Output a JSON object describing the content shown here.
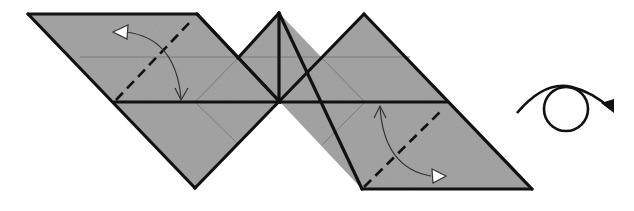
{
  "diagram": {
    "type": "origami-fold-diagram",
    "colors": {
      "paper_fill": "#a6a6a6",
      "edge": "#111111",
      "crease": "#7a7a7a",
      "arrow": "#333333",
      "background": "#ffffff"
    },
    "steps": [
      {
        "id": "valley-fold-left",
        "kind": "valley-fold",
        "arrow": "fold-and-unfold"
      },
      {
        "id": "valley-fold-right",
        "kind": "valley-fold",
        "arrow": "fold-and-unfold"
      },
      {
        "id": "turn-over",
        "kind": "turn-over-symbol"
      }
    ]
  }
}
